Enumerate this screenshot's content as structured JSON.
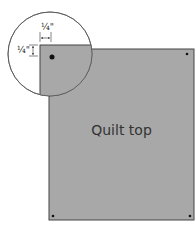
{
  "diagram": {
    "label": "Quilt top",
    "dimension_horizontal": "¼\"",
    "dimension_vertical": "¼\"",
    "colors": {
      "fill": "#a8a8a8",
      "stroke": "#444444",
      "dot": "#111111"
    }
  }
}
